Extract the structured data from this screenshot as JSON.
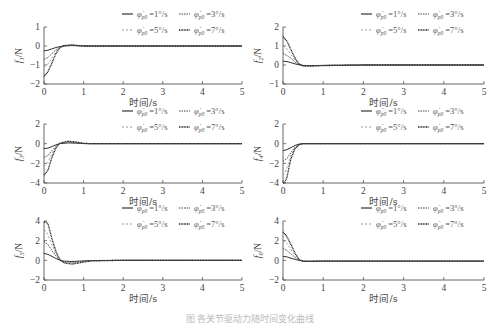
{
  "chart_data": [
    {
      "type": "line",
      "ylabel": "f1/N",
      "ylabel_main": "f",
      "ylabel_sub": "1",
      "ylabel_unit": "/N",
      "xlabel": "时间/s",
      "xlim": [
        0,
        5
      ],
      "ylim": [
        -2,
        1
      ],
      "xticks": [
        "0",
        "1",
        "2",
        "3",
        "4",
        "5"
      ],
      "yticks": [
        "-2",
        "-1",
        "0",
        "1"
      ],
      "legend": [
        "φ̇p0=1°/s",
        "φ̇p0=3°/s",
        "φ̇p0=5°/s",
        "φ̇p0=7°/s"
      ],
      "series": [
        {
          "name": "φ̇p0=1°/s",
          "x": [
            0,
            0.1,
            0.2,
            0.3,
            0.4,
            0.5,
            0.7,
            1,
            2,
            5
          ],
          "y": [
            -0.25,
            -0.22,
            -0.15,
            -0.08,
            -0.03,
            0,
            0.02,
            0,
            0,
            0
          ]
        },
        {
          "name": "φ̇p0=3°/s",
          "x": [
            0,
            0.1,
            0.2,
            0.3,
            0.4,
            0.5,
            0.7,
            1,
            2,
            5
          ],
          "y": [
            -0.7,
            -0.6,
            -0.4,
            -0.2,
            -0.06,
            0.01,
            0.04,
            0,
            0,
            0
          ]
        },
        {
          "name": "φ̇p0=5°/s",
          "x": [
            0,
            0.1,
            0.2,
            0.3,
            0.4,
            0.5,
            0.7,
            1,
            2,
            5
          ],
          "y": [
            -1.1,
            -0.95,
            -0.65,
            -0.3,
            -0.08,
            0.02,
            0.05,
            0,
            0,
            0
          ]
        },
        {
          "name": "φ̇p0=7°/s",
          "x": [
            0,
            0.1,
            0.2,
            0.3,
            0.4,
            0.5,
            0.7,
            1,
            2,
            5
          ],
          "y": [
            -1.6,
            -1.35,
            -0.9,
            -0.4,
            -0.1,
            0.02,
            0.06,
            0,
            0,
            0
          ]
        }
      ]
    },
    {
      "type": "line",
      "ylabel": "f2/N",
      "ylabel_main": "f",
      "ylabel_sub": "2",
      "ylabel_unit": "/N",
      "xlabel": "时间/s",
      "xlim": [
        0,
        5
      ],
      "ylim": [
        -1,
        2
      ],
      "xticks": [
        "0",
        "1",
        "2",
        "3",
        "4",
        "5"
      ],
      "yticks": [
        "-1",
        "0",
        "1",
        "2"
      ],
      "legend": [
        "φ̇p0=1°/s",
        "φ̇p0=3°/s",
        "φ̇p0=5°/s",
        "φ̇p0=7°/s"
      ],
      "series": [
        {
          "name": "φ̇p0=1°/s",
          "x": [
            0,
            0.1,
            0.2,
            0.3,
            0.4,
            0.5,
            0.7,
            1,
            2,
            5
          ],
          "y": [
            0.2,
            0.18,
            0.12,
            0.06,
            0.01,
            -0.02,
            -0.03,
            -0.02,
            0,
            0
          ]
        },
        {
          "name": "φ̇p0=3°/s",
          "x": [
            0,
            0.1,
            0.2,
            0.3,
            0.4,
            0.5,
            0.7,
            1,
            2,
            5
          ],
          "y": [
            0.6,
            0.5,
            0.35,
            0.15,
            0.02,
            -0.03,
            -0.04,
            -0.02,
            0,
            0
          ]
        },
        {
          "name": "φ̇p0=5°/s",
          "x": [
            0,
            0.1,
            0.2,
            0.3,
            0.4,
            0.5,
            0.7,
            1,
            2,
            5
          ],
          "y": [
            1.0,
            0.85,
            0.55,
            0.25,
            0.04,
            -0.04,
            -0.05,
            -0.02,
            0,
            0
          ]
        },
        {
          "name": "φ̇p0=7°/s",
          "x": [
            0,
            0.1,
            0.2,
            0.3,
            0.4,
            0.5,
            0.7,
            1,
            2,
            5
          ],
          "y": [
            1.5,
            1.25,
            0.8,
            0.35,
            0.06,
            -0.05,
            -0.06,
            -0.03,
            0,
            0
          ]
        }
      ]
    },
    {
      "type": "line",
      "ylabel": "f3/N",
      "ylabel_main": "f",
      "ylabel_sub": "3",
      "ylabel_unit": "/N",
      "xlabel": "时间/s",
      "xlim": [
        0,
        5
      ],
      "ylim": [
        -4,
        2
      ],
      "xticks": [
        "0",
        "1",
        "2",
        "3",
        "4",
        "5"
      ],
      "yticks": [
        "-4",
        "-2",
        "0",
        "2"
      ],
      "legend": [
        "φ̇p0=1°/s",
        "φ̇p0=3°/s",
        "φ̇p0=5°/s",
        "φ̇p0=7°/s"
      ],
      "series": [
        {
          "name": "φ̇p0=1°/s",
          "x": [
            0,
            0.1,
            0.2,
            0.3,
            0.4,
            0.6,
            0.8,
            1,
            1.2,
            2,
            5
          ],
          "y": [
            -0.5,
            -0.45,
            -0.3,
            -0.12,
            0,
            0.08,
            0.05,
            0.01,
            0,
            0,
            0
          ]
        },
        {
          "name": "φ̇p0=3°/s",
          "x": [
            0,
            0.1,
            0.2,
            0.3,
            0.4,
            0.6,
            0.8,
            1,
            1.2,
            2,
            5
          ],
          "y": [
            -1.4,
            -1.2,
            -0.7,
            -0.25,
            0.02,
            0.15,
            0.1,
            0.02,
            0,
            0,
            0
          ]
        },
        {
          "name": "φ̇p0=5°/s",
          "x": [
            0,
            0.1,
            0.2,
            0.3,
            0.4,
            0.6,
            0.8,
            1,
            1.2,
            2,
            5
          ],
          "y": [
            -2.3,
            -1.9,
            -1.0,
            -0.35,
            0.03,
            0.2,
            0.14,
            0.03,
            0,
            0,
            0
          ]
        },
        {
          "name": "φ̇p0=7°/s",
          "x": [
            0,
            0.1,
            0.2,
            0.3,
            0.4,
            0.6,
            0.8,
            1,
            1.2,
            2,
            5
          ],
          "y": [
            -3.2,
            -2.7,
            -1.4,
            -0.45,
            0.04,
            0.25,
            0.18,
            0.04,
            0,
            0,
            0
          ]
        }
      ]
    },
    {
      "type": "line",
      "ylabel": "f4/N",
      "ylabel_main": "f",
      "ylabel_sub": "4",
      "ylabel_unit": "/N",
      "xlabel": "时间/s",
      "xlim": [
        0,
        5
      ],
      "ylim": [
        -4,
        2
      ],
      "xticks": [
        "0",
        "1",
        "2",
        "3",
        "4",
        "5"
      ],
      "yticks": [
        "-4",
        "-2",
        "0",
        "2"
      ],
      "legend": [
        "φ̇p0=1°/s",
        "φ̇p0=3°/s",
        "φ̇p0=5°/s",
        "φ̇p0=7°/s"
      ],
      "series": [
        {
          "name": "φ̇p0=1°/s",
          "x": [
            0,
            0.1,
            0.2,
            0.3,
            0.4,
            0.5,
            1,
            5
          ],
          "y": [
            -0.7,
            -0.6,
            -0.4,
            -0.18,
            -0.04,
            0,
            0,
            0
          ]
        },
        {
          "name": "φ̇p0=3°/s",
          "x": [
            0,
            0.1,
            0.2,
            0.3,
            0.4,
            0.5,
            1,
            5
          ],
          "y": [
            -1.8,
            -1.5,
            -0.9,
            -0.35,
            -0.06,
            0,
            0,
            0
          ]
        },
        {
          "name": "φ̇p0=5°/s",
          "x": [
            0,
            0.05,
            0.1,
            0.2,
            0.3,
            0.4,
            0.5,
            1,
            5
          ],
          "y": [
            -3.2,
            -3.0,
            -2.4,
            -1.2,
            -0.45,
            -0.08,
            0,
            0,
            0
          ]
        },
        {
          "name": "φ̇p0=7°/s",
          "x": [
            0,
            0.05,
            0.1,
            0.15,
            0.2,
            0.3,
            0.4,
            0.5,
            1,
            5
          ],
          "y": [
            -4.0,
            -3.9,
            -3.4,
            -2.4,
            -1.5,
            -0.5,
            -0.1,
            0,
            0,
            0
          ]
        }
      ]
    },
    {
      "type": "line",
      "ylabel": "f5/N",
      "ylabel_main": "f",
      "ylabel_sub": "5",
      "ylabel_unit": "/N",
      "xlabel": "时间/s",
      "xlim": [
        0,
        5
      ],
      "ylim": [
        -2,
        4
      ],
      "xticks": [
        "0",
        "1",
        "2",
        "3",
        "4",
        "5"
      ],
      "yticks": [
        "-2",
        "0",
        "2",
        "4"
      ],
      "legend": [
        "φ̇p0=1°/s",
        "φ̇p0=3°/s",
        "φ̇p0=5°/s",
        "φ̇p0=7°/s"
      ],
      "series": [
        {
          "name": "φ̇p0=1°/s",
          "x": [
            0,
            0.1,
            0.2,
            0.3,
            0.4,
            0.5,
            0.7,
            0.9,
            1.2,
            2,
            5
          ],
          "y": [
            0.7,
            0.6,
            0.4,
            0.2,
            0.02,
            -0.08,
            -0.12,
            -0.08,
            -0.02,
            0,
            0
          ]
        },
        {
          "name": "φ̇p0=3°/s",
          "x": [
            0,
            0.1,
            0.2,
            0.3,
            0.4,
            0.5,
            0.7,
            0.9,
            1.2,
            2,
            5
          ],
          "y": [
            1.9,
            1.6,
            1.0,
            0.45,
            0.05,
            -0.15,
            -0.22,
            -0.14,
            -0.04,
            0,
            0
          ]
        },
        {
          "name": "φ̇p0=5°/s",
          "x": [
            0,
            0.05,
            0.1,
            0.2,
            0.3,
            0.4,
            0.5,
            0.7,
            0.9,
            1.2,
            2,
            5
          ],
          "y": [
            3.0,
            3.0,
            2.6,
            1.6,
            0.65,
            0.08,
            -0.2,
            -0.3,
            -0.2,
            -0.05,
            0,
            0
          ]
        },
        {
          "name": "φ̇p0=7°/s",
          "x": [
            0,
            0.05,
            0.1,
            0.15,
            0.2,
            0.3,
            0.4,
            0.5,
            0.7,
            0.9,
            1.2,
            2,
            5
          ],
          "y": [
            3.9,
            3.9,
            3.7,
            3.0,
            2.2,
            0.9,
            0.1,
            -0.25,
            -0.38,
            -0.25,
            -0.06,
            0,
            0
          ]
        }
      ]
    },
    {
      "type": "line",
      "ylabel": "f6/N",
      "ylabel_main": "f",
      "ylabel_sub": "6",
      "ylabel_unit": "/N",
      "xlabel": "时间/s",
      "xlim": [
        0,
        5
      ],
      "ylim": [
        -2,
        4
      ],
      "xticks": [
        "0",
        "1",
        "2",
        "3",
        "4",
        "5"
      ],
      "yticks": [
        "-2",
        "0",
        "2",
        "4"
      ],
      "legend": [
        "φ̇p0=1°/s",
        "φ̇p0=3°/s",
        "φ̇p0=5°/s",
        "φ̇p0=7°/s"
      ],
      "series": [
        {
          "name": "φ̇p0=1°/s",
          "x": [
            0,
            0.1,
            0.2,
            0.3,
            0.4,
            0.5,
            0.7,
            1,
            5
          ],
          "y": [
            0.4,
            0.35,
            0.22,
            0.1,
            0,
            -0.08,
            -0.1,
            -0.08,
            -0.08
          ]
        },
        {
          "name": "φ̇p0=3°/s",
          "x": [
            0,
            0.1,
            0.2,
            0.3,
            0.4,
            0.5,
            0.7,
            1,
            5
          ],
          "y": [
            1.2,
            1.0,
            0.65,
            0.3,
            0.02,
            -0.1,
            -0.1,
            -0.08,
            -0.08
          ]
        },
        {
          "name": "φ̇p0=5°/s",
          "x": [
            0,
            0.1,
            0.2,
            0.3,
            0.4,
            0.5,
            0.7,
            1,
            5
          ],
          "y": [
            2.0,
            1.7,
            1.1,
            0.5,
            0.05,
            -0.1,
            -0.1,
            -0.08,
            -0.08
          ]
        },
        {
          "name": "φ̇p0=7°/s",
          "x": [
            0,
            0.1,
            0.2,
            0.3,
            0.4,
            0.5,
            0.7,
            1,
            5
          ],
          "y": [
            2.9,
            2.4,
            1.6,
            0.7,
            0.08,
            -0.1,
            -0.1,
            -0.08,
            -0.08
          ]
        }
      ]
    }
  ],
  "legend_labels": {
    "main": "φ̇",
    "sub": "p0",
    "values": [
      "=1°/s",
      "=3°/s",
      "=5°/s",
      "=7°/s"
    ]
  },
  "series_styles": [
    {
      "color": "#333333",
      "dash": "",
      "width": 1.0
    },
    {
      "color": "#444444",
      "dash": "1.5,1",
      "width": 0.9
    },
    {
      "color": "#999999",
      "dash": "2,2",
      "width": 0.9
    },
    {
      "color": "#222222",
      "dash": "1,0.6",
      "width": 1.3
    }
  ],
  "caption": "图 各关节驱动力随时间变化曲线"
}
